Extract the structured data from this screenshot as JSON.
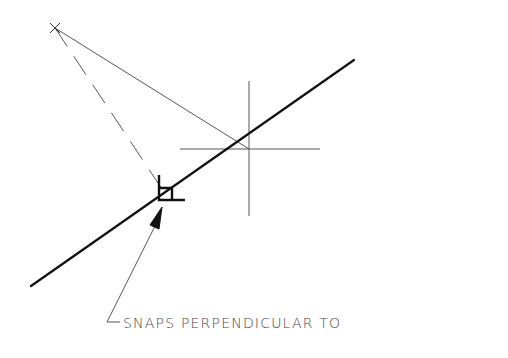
{
  "diagram": {
    "annotation": {
      "label": "SNAPS PERPENDICULAR TO"
    },
    "elements": {
      "object_line": {
        "x1": 31,
        "y1": 286,
        "x2": 354,
        "y2": 60
      },
      "pick_point": {
        "x": 55,
        "y": 28
      },
      "crosshair": {
        "cx": 249,
        "cy": 149,
        "h_left": 180,
        "h_right": 320,
        "v_top": 81,
        "v_bottom": 216
      },
      "rubber_band": {
        "x1": 55,
        "y1": 28,
        "x2": 249,
        "y2": 149
      },
      "perpendicular_projection": {
        "x1": 55,
        "y1": 28,
        "x2": 164,
        "y2": 192
      },
      "perpendicular_marker": {
        "x": 159,
        "y": 175,
        "width": 26,
        "height": 25
      },
      "leader": {
        "tip_x": 162,
        "tip_y": 208,
        "bend_x": 107,
        "bend_y": 322,
        "end_x": 120,
        "end_y": 322
      }
    },
    "colors": {
      "background": "#ffffff",
      "thick_line": "#111111",
      "thin_line": "#555555",
      "text": "#444444"
    }
  }
}
